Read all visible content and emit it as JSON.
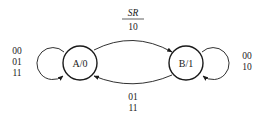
{
  "diagram": {
    "type": "state-machine (Moore)",
    "states": [
      {
        "id": "A",
        "label": "A/0",
        "output": "0"
      },
      {
        "id": "B",
        "label": "B/1",
        "output": "1"
      }
    ],
    "transitions": [
      {
        "from": "A",
        "to": "A",
        "label_lines": [
          "00",
          "01",
          "11"
        ]
      },
      {
        "from": "A",
        "to": "B",
        "header": "SR",
        "label_lines": [
          "10"
        ]
      },
      {
        "from": "B",
        "to": "A",
        "label_lines": [
          "01",
          "11"
        ]
      },
      {
        "from": "B",
        "to": "B",
        "label_lines": [
          "00",
          "10"
        ]
      }
    ]
  },
  "colors": {
    "stroke": "#1a1a1a",
    "background": "#ffffff"
  }
}
